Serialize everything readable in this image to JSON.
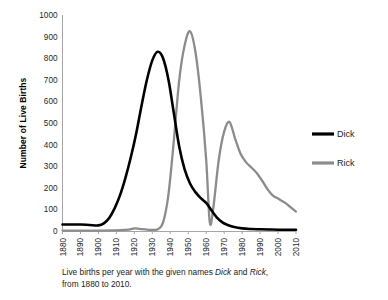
{
  "figure": {
    "caption_line1_pre": "Live births per year with the given names ",
    "caption_name1": "Dick",
    "caption_mid": " and ",
    "caption_name2": "Rick",
    "caption_line1_post": ",",
    "caption_line2": "from 1880 to 2010."
  },
  "chart_data": {
    "type": "line",
    "title": "",
    "xlabel": "",
    "ylabel": "Number of Live Births",
    "xlim": [
      1880,
      2010
    ],
    "ylim": [
      0,
      1000
    ],
    "grid": false,
    "legend_position": "right",
    "x_ticks": [
      "1880",
      "1890",
      "1900",
      "1910",
      "1920",
      "1930",
      "1940",
      "1950",
      "1960",
      "1970",
      "1980",
      "1990",
      "2000",
      "2010"
    ],
    "y_ticks": [
      "0",
      "100",
      "200",
      "300",
      "400",
      "500",
      "600",
      "700",
      "800",
      "900",
      "1000"
    ],
    "colors": {
      "dick": "#000000",
      "rick": "#8c8c8c",
      "axis": "#a6a6a6",
      "background": "#ffffff"
    },
    "series": [
      {
        "name": "Dick",
        "color": "#000000",
        "x": [
          1880,
          1885,
          1890,
          1895,
          1900,
          1903,
          1906,
          1909,
          1912,
          1915,
          1918,
          1921,
          1924,
          1927,
          1930,
          1933,
          1936,
          1939,
          1942,
          1945,
          1948,
          1951,
          1954,
          1957,
          1960,
          1963,
          1966,
          1969,
          1972,
          1975,
          1980,
          1985,
          1990,
          1995,
          2000,
          2005,
          2010
        ],
        "values": [
          30,
          30,
          30,
          28,
          26,
          35,
          60,
          105,
          165,
          245,
          340,
          450,
          580,
          700,
          790,
          830,
          800,
          700,
          545,
          390,
          285,
          220,
          180,
          152,
          130,
          95,
          62,
          40,
          28,
          20,
          12,
          9,
          8,
          7,
          6,
          6,
          6
        ]
      },
      {
        "name": "Rick",
        "color": "#8c8c8c",
        "x": [
          1880,
          1900,
          1915,
          1920,
          1923,
          1927,
          1930,
          1933,
          1936,
          1939,
          1942,
          1945,
          1948,
          1951,
          1954,
          1957,
          1960,
          1962,
          1964,
          1967,
          1970,
          1973,
          1976,
          1979,
          1982,
          1985,
          1988,
          1991,
          1994,
          1997,
          2000,
          2004,
          2007,
          2010
        ],
        "values": [
          2,
          2,
          5,
          12,
          10,
          6,
          5,
          8,
          40,
          170,
          420,
          700,
          860,
          925,
          830,
          620,
          330,
          40,
          110,
          330,
          460,
          505,
          430,
          360,
          320,
          295,
          270,
          235,
          195,
          165,
          150,
          130,
          110,
          90
        ]
      }
    ],
    "legend": [
      {
        "label": "Dick",
        "color": "#000000"
      },
      {
        "label": "Rick",
        "color": "#8c8c8c"
      }
    ]
  }
}
